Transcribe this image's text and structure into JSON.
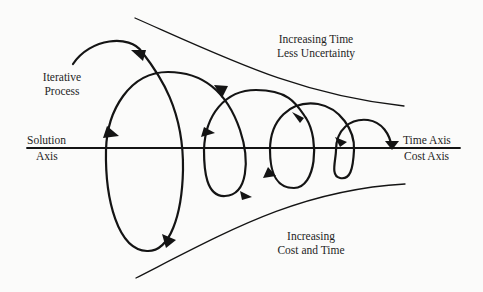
{
  "diagram": {
    "type": "spiral-convergence-diagram",
    "labels": {
      "iterative_process": [
        "Iterative",
        "Process"
      ],
      "top_region": [
        "Increasing Time",
        "Less Uncertainty"
      ],
      "bottom_region": [
        "Increasing",
        "Cost and Time"
      ],
      "left_axis": [
        "Solution",
        "Axis"
      ],
      "right_axis": [
        "Time Axis",
        "Cost Axis"
      ]
    },
    "elements": {
      "axis": "horizontal solution/time/cost axis",
      "upper_bound": "converging upper funnel curve",
      "lower_bound": "converging lower funnel curve",
      "spiral": "iterative spiral with decreasing loops and direction arrows",
      "loop_count": 4
    },
    "colors": {
      "ink": "#141414",
      "background": "#fbfbfa"
    }
  }
}
